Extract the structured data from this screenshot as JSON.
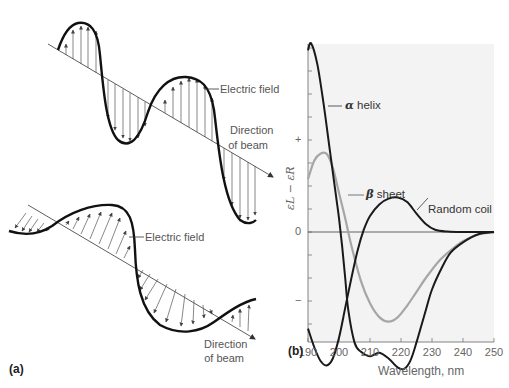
{
  "panel_a": {
    "tag": "(a)",
    "top_wave": {
      "description": "Circularly polarized light: electric field vectors perpendicular to beam",
      "field_label": "Electric field",
      "direction_label_line1": "Direction",
      "direction_label_line2": "of beam"
    },
    "bottom_wave": {
      "description": "Electric field vectors tilted relative to beam",
      "field_label": "Electric field",
      "direction_label_line1": "Direction",
      "direction_label_line2": "of beam"
    }
  },
  "panel_b": {
    "tag": "(b)",
    "curve_labels": {
      "alpha_greek": "α",
      "alpha_text": " helix",
      "beta_greek": "β",
      "beta_text": " sheet",
      "random": "Random coil"
    }
  },
  "chart_data": {
    "type": "line",
    "title": "",
    "xlabel": "Wavelength, nm",
    "ylabel": "εL − εR",
    "x_ticks": [
      190,
      200,
      210,
      220,
      230,
      240,
      250
    ],
    "y_tick_labels": [
      {
        "value": 4,
        "label": "+"
      },
      {
        "value": 0,
        "label": "0"
      },
      {
        "value": -3,
        "label": "−"
      }
    ],
    "xlim": [
      190,
      250
    ],
    "ylim": [
      -7.8,
      8.3
    ],
    "grid": false,
    "legend": "inline labels",
    "zero_line": true,
    "series": [
      {
        "name": "α helix",
        "color": "#1a1a1a",
        "x": [
          190,
          191,
          193,
          195,
          197,
          199,
          200,
          201,
          202,
          203,
          205,
          207,
          210,
          213,
          216,
          219,
          221,
          223,
          225,
          228,
          230,
          233,
          236,
          240,
          245,
          250
        ],
        "y": [
          7.9,
          8.2,
          7.3,
          5.6,
          3.6,
          1.6,
          0.6,
          -0.6,
          -2.0,
          -3.4,
          -4.8,
          -5.2,
          -5.4,
          -5.25,
          -5.5,
          -5.9,
          -5.95,
          -5.6,
          -4.8,
          -3.4,
          -2.5,
          -1.6,
          -0.9,
          -0.45,
          -0.1,
          0
        ]
      },
      {
        "name": "β sheet",
        "color": "#a6a6a6",
        "x": [
          190,
          192,
          194,
          196,
          198,
          200,
          202,
          204,
          207,
          210,
          213,
          216,
          219,
          222,
          225,
          228,
          232,
          236,
          240,
          245,
          250
        ],
        "y": [
          2.3,
          3.1,
          3.4,
          3.4,
          2.8,
          1.7,
          0.6,
          -0.6,
          -2.1,
          -3.1,
          -3.7,
          -3.9,
          -3.7,
          -3.2,
          -2.6,
          -2.0,
          -1.3,
          -0.8,
          -0.4,
          -0.1,
          0
        ]
      },
      {
        "name": "Random coil",
        "color": "#1a1a1a",
        "x": [
          190,
          192,
          194,
          196,
          198,
          200,
          202,
          204,
          206,
          208,
          210,
          213,
          216,
          219,
          222,
          225,
          228,
          231,
          235,
          240,
          250
        ],
        "y": [
          -4.2,
          -5.0,
          -5.6,
          -5.8,
          -5.5,
          -4.6,
          -3.3,
          -2.0,
          -0.8,
          0.1,
          0.7,
          1.2,
          1.45,
          1.5,
          1.3,
          0.8,
          0.35,
          0.1,
          0.02,
          0,
          0
        ]
      }
    ]
  }
}
